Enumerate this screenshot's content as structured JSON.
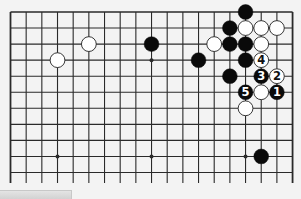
{
  "board": {
    "columns": 19,
    "visible_rows": 11,
    "origin_x": 10.5,
    "origin_y": 12,
    "spacing_x": 15.67,
    "spacing_y": 16.05,
    "line_bottom_y": 183,
    "stone_radius": 7.4,
    "colors": {
      "background": "#f3f3f3",
      "line": "#2a2a2a",
      "black_stone": "#0a0a0a",
      "white_stone": "#ffffff",
      "white_stone_border": "#222222"
    },
    "star_points": [
      [
        9,
        3
      ],
      [
        15,
        3
      ],
      [
        3,
        9
      ],
      [
        9,
        9
      ],
      [
        15,
        9
      ]
    ],
    "stones": [
      {
        "color": "black",
        "col": 15,
        "row": 0,
        "label": ""
      },
      {
        "color": "black",
        "col": 14,
        "row": 1,
        "label": ""
      },
      {
        "color": "white",
        "col": 15,
        "row": 1,
        "label": ""
      },
      {
        "color": "white",
        "col": 16,
        "row": 1,
        "label": ""
      },
      {
        "color": "white",
        "col": 17,
        "row": 1,
        "label": ""
      },
      {
        "color": "white",
        "col": 5,
        "row": 2,
        "label": ""
      },
      {
        "color": "black",
        "col": 9,
        "row": 2,
        "label": ""
      },
      {
        "color": "white",
        "col": 13,
        "row": 2,
        "label": ""
      },
      {
        "color": "black",
        "col": 14,
        "row": 2,
        "label": ""
      },
      {
        "color": "black",
        "col": 15,
        "row": 2,
        "label": ""
      },
      {
        "color": "white",
        "col": 16,
        "row": 2,
        "label": ""
      },
      {
        "color": "white",
        "col": 3,
        "row": 3,
        "label": ""
      },
      {
        "color": "black",
        "col": 12,
        "row": 3,
        "label": ""
      },
      {
        "color": "black",
        "col": 15,
        "row": 3,
        "label": ""
      },
      {
        "color": "white",
        "col": 16,
        "row": 3,
        "label": "4"
      },
      {
        "color": "black",
        "col": 14,
        "row": 4,
        "label": ""
      },
      {
        "color": "black",
        "col": 16,
        "row": 4,
        "label": "3"
      },
      {
        "color": "white",
        "col": 17,
        "row": 4,
        "label": "2"
      },
      {
        "color": "black",
        "col": 15,
        "row": 5,
        "label": "5"
      },
      {
        "color": "white",
        "col": 16,
        "row": 5,
        "label": ""
      },
      {
        "color": "black",
        "col": 17,
        "row": 5,
        "label": "1"
      },
      {
        "color": "white",
        "col": 15,
        "row": 6,
        "label": ""
      },
      {
        "color": "black",
        "col": 16,
        "row": 9,
        "label": ""
      }
    ]
  },
  "tab_strip": {
    "label": ""
  }
}
